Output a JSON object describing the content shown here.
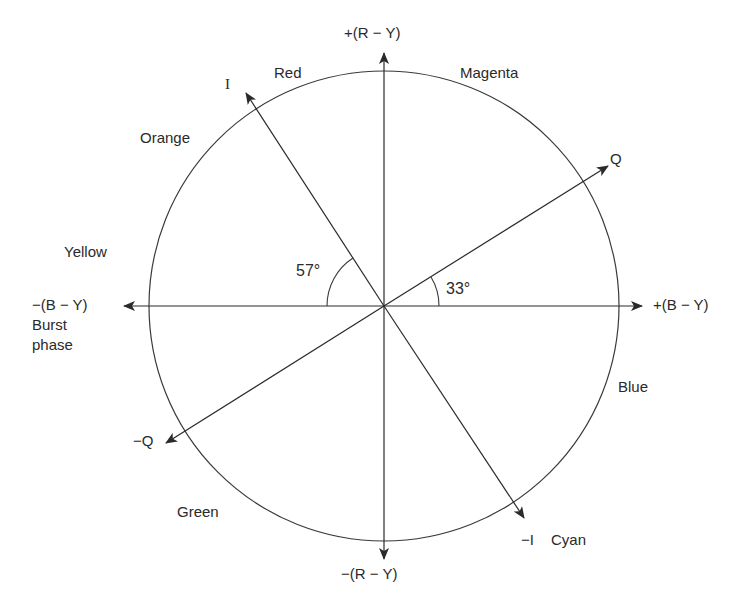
{
  "diagram": {
    "axes": {
      "plus_r_y": "+(R − Y)",
      "minus_r_y": "−(R − Y)",
      "plus_b_y": "+(B − Y)",
      "minus_b_y": "−(B − Y)",
      "burst_phase": [
        "Burst",
        "phase"
      ],
      "i": "I",
      "minus_i": "−I",
      "q": "Q",
      "minus_q": "−Q"
    },
    "angles": {
      "i_angle": "57°",
      "q_angle": "33°"
    },
    "colors": {
      "red": "Red",
      "magenta": "Magenta",
      "orange": "Orange",
      "yellow": "Yellow",
      "blue": "Blue",
      "green": "Green",
      "cyan": "Cyan"
    },
    "style": {
      "line_color": "#3a3a3a",
      "background": "#ffffff"
    }
  }
}
